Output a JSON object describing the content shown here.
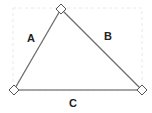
{
  "diagram": {
    "type": "triangle",
    "colors": {
      "edge": "#6b6b6b",
      "vertex_fill": "#ffffff",
      "vertex_stroke": "#555555",
      "label": "#222222",
      "frame": "#e6e6e6"
    },
    "vertices": [
      {
        "id": "top",
        "x": 61,
        "y": 9
      },
      {
        "id": "bottom-left",
        "x": 14,
        "y": 90
      },
      {
        "id": "bottom-right",
        "x": 142,
        "y": 90
      }
    ],
    "edges": [
      {
        "label": "A",
        "from": "bottom-left",
        "to": "top"
      },
      {
        "label": "B",
        "from": "top",
        "to": "bottom-right"
      },
      {
        "label": "C",
        "from": "bottom-left",
        "to": "bottom-right"
      }
    ],
    "labels": {
      "a": "A",
      "b": "B",
      "c": "C"
    }
  }
}
